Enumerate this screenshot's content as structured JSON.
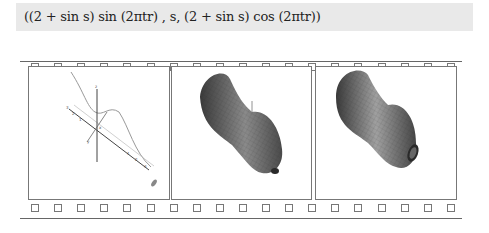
{
  "formula": {
    "text": "((2 + sin s) sin (2πtr) , s, (2 + sin s) cos (2πtr))"
  },
  "filmstrip": {
    "top_holes": 19,
    "bottom_holes": 19,
    "frames": [
      {
        "id": 1,
        "content": "space curve with 3D axes and tick labels"
      },
      {
        "id": 2,
        "content": "partially swept surface of revolution (shaded mesh)"
      },
      {
        "id": 3,
        "content": "full surface of revolution (shaded mesh)"
      }
    ]
  },
  "colors": {
    "formula_bg": "#e9e9e9",
    "border": "#777777",
    "surface_dark": "#3a3a3a",
    "surface_light": "#b0b0b0"
  }
}
